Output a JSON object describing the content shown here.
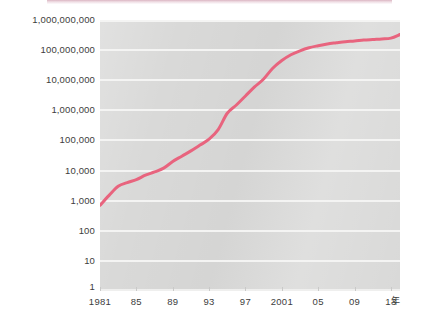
{
  "figure": {
    "background_color": "#ffffff",
    "plot_background_color": "#d9d9d8",
    "gridline_color": "#f4f4f3",
    "series_color": "#e8647e",
    "top_banner_color": "#be7891"
  },
  "axes": {
    "x_unit_label": "年",
    "x_tick_labels": [
      "1981",
      "85",
      "89",
      "93",
      "97",
      "2001",
      "05",
      "09",
      "13"
    ],
    "x_tick_values": [
      1981,
      1985,
      1989,
      1993,
      1997,
      2001,
      2005,
      2009,
      2013
    ],
    "y_tick_labels": [
      "1,000,000,000",
      "100,000,000",
      "10,000,000",
      "1,000,000",
      "100,000",
      "10,000",
      "1,000",
      "100",
      "10",
      "1"
    ],
    "y_tick_values": [
      1000000000,
      100000000,
      10000000,
      1000000,
      100000,
      10000,
      1000,
      100,
      10,
      1
    ]
  },
  "chart_data": {
    "type": "line",
    "title": "",
    "subtitle": "",
    "xlabel": "年",
    "ylabel": "",
    "yscale": "log",
    "xscale": "linear",
    "xlim": [
      1981,
      2014
    ],
    "ylim": [
      1,
      1000000000
    ],
    "grid": true,
    "legend": false,
    "legend_position": "none",
    "series": [
      {
        "name": "累計",
        "color": "#e8647e",
        "line_width": 3,
        "x": [
          1981,
          1982,
          1983,
          1984,
          1985,
          1986,
          1987,
          1988,
          1989,
          1990,
          1991,
          1992,
          1993,
          1994,
          1995,
          1996,
          1997,
          1998,
          1999,
          2000,
          2001,
          2002,
          2003,
          2004,
          2005,
          2006,
          2007,
          2008,
          2009,
          2010,
          2011,
          2012,
          2013,
          2014
        ],
        "values": [
          700,
          1500,
          3000,
          4000,
          5000,
          7000,
          9000,
          12000,
          20000,
          30000,
          45000,
          70000,
          110000,
          230000,
          800000,
          1500000,
          3000000,
          6000000,
          11000000,
          25000000,
          45000000,
          70000000,
          95000000,
          120000000,
          140000000,
          160000000,
          175000000,
          190000000,
          200000000,
          215000000,
          225000000,
          235000000,
          250000000,
          330000000
        ]
      }
    ],
    "annotations": []
  }
}
